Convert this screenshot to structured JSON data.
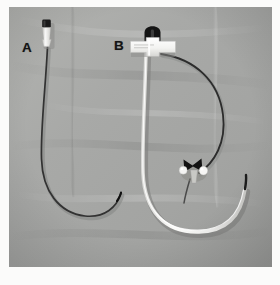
{
  "figure": {
    "kind": "photograph",
    "border_color": "#fbfbfa",
    "background_color": "#a6a7a5",
    "width": 280,
    "height": 285
  },
  "panels": [
    {
      "id": "a",
      "label": "A",
      "device": "thin dark pigtail drainage catheter",
      "hub_cap_color": "#1d1d1d",
      "hub_body_color": "#efefed",
      "shaft_color": "#3b3b3b",
      "shaft_width_px": 1.6,
      "tip_shape": "J-shaped pigtail curl"
    },
    {
      "id": "b",
      "label": "B",
      "device": "white large-bore catheter with T-wing hub, stopcock and guidewire",
      "hub_cap_color": "#181818",
      "hub_body_color": "#fafaf8",
      "shaft_color": "#f6f6f4",
      "shaft_width_px": 3.4,
      "guidewire_color": "#2b2b2b",
      "guidewire_width_px": 1.7,
      "stopcock_color": "#151515",
      "stopcock_knob_color": "#f2f2f0",
      "tip_shape": "U-shaped loop"
    }
  ],
  "colors": {
    "cloth_light": "#b3b4b1",
    "cloth_mid": "#a6a7a5",
    "cloth_dark": "#969795",
    "shadow": "#7d7e7c",
    "ink": "#141414",
    "white_plastic": "#f7f7f5"
  }
}
